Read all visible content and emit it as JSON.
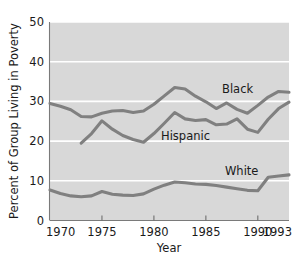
{
  "chart_data": {
    "type": "line",
    "title": "",
    "xlabel": "Year",
    "ylabel": "Percent of Group Living in Poverty",
    "xlim": [
      1970,
      1993
    ],
    "ylim": [
      0,
      50
    ],
    "grid": true,
    "legend_position": "inline-labels",
    "y_ticks": [
      "0",
      "10",
      "20",
      "30",
      "40",
      "50"
    ],
    "y_tick_values": [
      0,
      10,
      20,
      30,
      40,
      50
    ],
    "x_ticks": [
      "1970",
      "1975",
      "1980",
      "1985",
      "1990",
      "1993"
    ],
    "x_tick_values": [
      1970,
      1975,
      1980,
      1985,
      1990,
      1993
    ],
    "x": [
      1970,
      1971,
      1972,
      1973,
      1974,
      1975,
      1976,
      1977,
      1978,
      1979,
      1980,
      1981,
      1982,
      1983,
      1984,
      1985,
      1986,
      1987,
      1988,
      1989,
      1990,
      1991,
      1992,
      1993
    ],
    "series": [
      {
        "name": "Black",
        "color": "#808080",
        "label": "Black",
        "x": [
          1970,
          1971,
          1972,
          1973,
          1974,
          1975,
          1976,
          1977,
          1978,
          1979,
          1980,
          1981,
          1982,
          1983,
          1984,
          1985,
          1986,
          1987,
          1988,
          1989,
          1990,
          1991,
          1992,
          1993
        ],
        "values": [
          29.5,
          28.8,
          27.9,
          26.2,
          26.1,
          27.0,
          27.6,
          27.7,
          27.2,
          27.6,
          29.3,
          31.4,
          33.5,
          33.1,
          31.3,
          29.9,
          28.2,
          29.6,
          28.0,
          27.0,
          29.0,
          31.1,
          32.5,
          32.3
        ]
      },
      {
        "name": "Hispanic",
        "color": "#808080",
        "label": "Hispanic",
        "x": [
          1973,
          1974,
          1975,
          1976,
          1977,
          1978,
          1979,
          1980,
          1981,
          1982,
          1983,
          1984,
          1985,
          1986,
          1987,
          1988,
          1989,
          1990,
          1991,
          1992,
          1993
        ],
        "values": [
          19.5,
          21.9,
          25.1,
          23.0,
          21.4,
          20.4,
          19.7,
          21.9,
          24.5,
          27.2,
          25.6,
          25.2,
          25.4,
          24.1,
          24.3,
          25.6,
          23.0,
          22.2,
          25.5,
          28.2,
          29.8
        ]
      },
      {
        "name": "White",
        "color": "#808080",
        "label": "White",
        "x": [
          1970,
          1971,
          1972,
          1973,
          1974,
          1975,
          1976,
          1977,
          1978,
          1979,
          1980,
          1981,
          1982,
          1983,
          1984,
          1985,
          1986,
          1987,
          1988,
          1989,
          1990,
          1991,
          1992,
          1993
        ],
        "values": [
          7.7,
          6.8,
          6.2,
          6.0,
          6.2,
          7.3,
          6.6,
          6.4,
          6.3,
          6.7,
          7.9,
          8.9,
          9.7,
          9.5,
          9.2,
          9.1,
          8.8,
          8.4,
          8.0,
          7.6,
          7.5,
          10.9,
          11.2,
          11.5
        ]
      }
    ]
  },
  "labels": {
    "black": "Black",
    "hispanic": "Hispanic",
    "white": "White",
    "x_axis_title": "Year",
    "y_axis_title": "Percent of Group Living in Poverty"
  }
}
